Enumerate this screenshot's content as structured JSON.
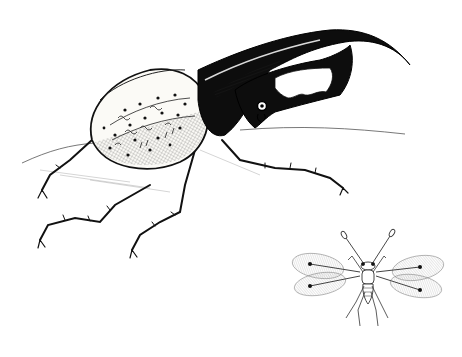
{
  "illustration": {
    "style": "pen-and-ink drawing",
    "background": "#ffffff",
    "ink": "#111111",
    "subjects": [
      {
        "name": "hercules-beetle",
        "description": "Large rhinoceros beetle with long curved thoracic horn and toothed cephalic horn, spotted pale elytra, six spiny legs"
      },
      {
        "name": "fairyfly",
        "description": "Tiny wasp with club-tipped antennae and four fringed feather-like wings, shown at bottom right"
      }
    ]
  }
}
